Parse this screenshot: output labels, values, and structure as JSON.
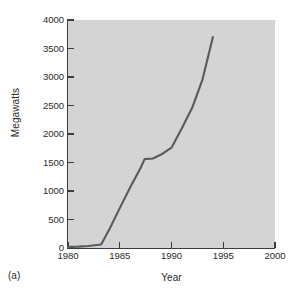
{
  "figure": {
    "panel_label": "(a)",
    "background_color": "#ffffff",
    "plot_background_color": "#d4d4d4",
    "line_color": "#5a5a5a"
  },
  "chart_data": {
    "type": "line",
    "title": "",
    "xlabel": "Year",
    "ylabel": "Megawatts",
    "xlim": [
      1980,
      2000
    ],
    "ylim": [
      0,
      4000
    ],
    "xticks": [
      1980,
      1985,
      1990,
      1995,
      2000
    ],
    "xtick_labels": [
      "1980",
      "1985",
      "1990",
      "1995",
      "2000"
    ],
    "yticks": [
      0,
      500,
      1000,
      1500,
      2000,
      2500,
      3000,
      3500,
      4000
    ],
    "ytick_labels": [
      "0",
      "500",
      "1000",
      "1500",
      "2000",
      "2500",
      "3000",
      "3500",
      "4000"
    ],
    "grid": false,
    "legend": null,
    "series": [
      {
        "name": "Installed capacity",
        "x": [
          1980.0,
          1981.0,
          1982.0,
          1983.2,
          1984.0,
          1985.0,
          1986.0,
          1987.0,
          1987.4,
          1988.2,
          1989.0,
          1990.0,
          1991.0,
          1992.0,
          1993.0,
          1994.0
        ],
        "y": [
          20,
          25,
          35,
          60,
          330,
          700,
          1060,
          1400,
          1560,
          1570,
          1640,
          1760,
          2100,
          2460,
          2960,
          3700
        ]
      }
    ]
  }
}
